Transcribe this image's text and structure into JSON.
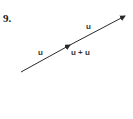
{
  "problem": {
    "number": "9."
  },
  "diagram": {
    "labels": {
      "first_vector": "u",
      "second_vector": "u",
      "resultant": "u + u"
    },
    "colors": {
      "stroke": "#2a2a2a",
      "text": "#333333"
    },
    "vectors": [
      {
        "name": "u",
        "from": [
          21,
          72
        ],
        "to": [
          70,
          45
        ]
      },
      {
        "name": "u",
        "from": [
          70,
          45
        ],
        "to": [
          125,
          16
        ]
      }
    ]
  }
}
